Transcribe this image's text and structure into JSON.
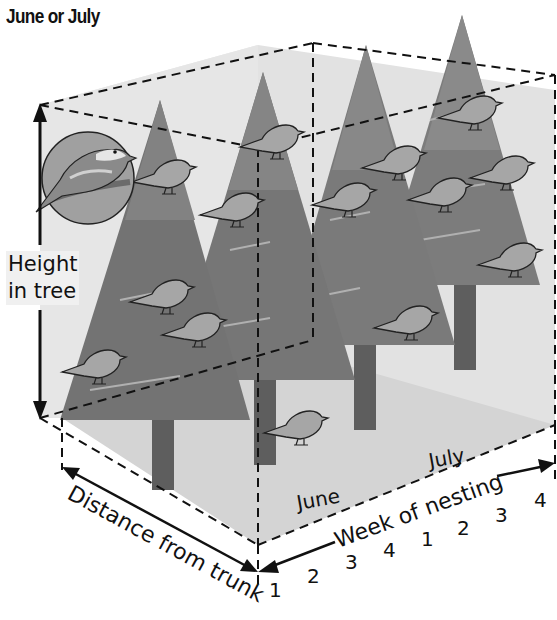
{
  "title": "June or July",
  "axes": {
    "vertical": {
      "label_line1": "Height",
      "label_line2": "in tree"
    },
    "depth": {
      "label": "Distance from trunk"
    },
    "horizontal": {
      "label": "Week of nesting",
      "months": [
        "June",
        "July"
      ],
      "ticks": [
        "1",
        "2",
        "3",
        "4",
        "1",
        "2",
        "3",
        "4"
      ]
    }
  },
  "inset": {
    "description": "close-up of warbler perched on branch"
  },
  "scene": {
    "trees": 4,
    "birds_count": 16
  },
  "colors": {
    "box_fill": "#e4e4e4",
    "ground_fill": "#d6d6d6",
    "tree_foliage": "#7a7a7a",
    "tree_highlight": "#a8a8a8",
    "trunk": "#5e5e5e",
    "bird_fill": "#a6a6a6",
    "line": "#111111"
  }
}
